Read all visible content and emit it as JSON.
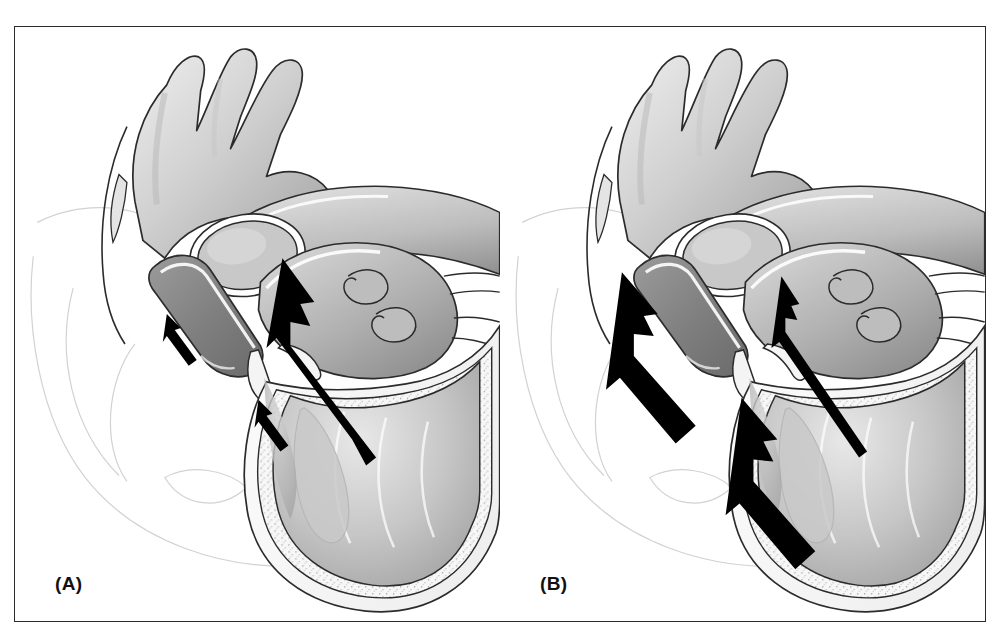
{
  "figure": {
    "kind": "medical-illustration",
    "view": "Four-chamber / long-axis cut with aortic arch",
    "style": "grayscale airbrushed line art",
    "frame_color": "#2b2b2b",
    "background_color": "#ffffff"
  },
  "panels": [
    {
      "id": "A",
      "label": "(A)",
      "caption_letter": "A",
      "arrows": [
        {
          "name": "left-atrium-inflow-arrow",
          "weight": "thin",
          "direction": "up-left"
        },
        {
          "name": "ventricle-inflow-arrow",
          "weight": "thin",
          "direction": "up-left"
        },
        {
          "name": "ventricle-outflow-arrow",
          "weight": "thick",
          "direction": "up-left"
        }
      ]
    },
    {
      "id": "B",
      "label": "(B)",
      "caption_letter": "B",
      "arrows": [
        {
          "name": "left-atrium-inflow-arrow",
          "weight": "thick",
          "direction": "up-left"
        },
        {
          "name": "ventricle-inflow-arrow",
          "weight": "thick",
          "direction": "up-left"
        },
        {
          "name": "ventricle-outflow-arrow",
          "weight": "thin",
          "direction": "up-left"
        }
      ]
    }
  ],
  "anatomy": {
    "structures": [
      "aortic arch",
      "brachiocephalic artery",
      "left common carotid artery",
      "left subclavian artery",
      "descending aorta",
      "right pulmonary artery (cross-section)",
      "left atrium",
      "pulmonary vein orifices",
      "left atrial appendage",
      "mitral valve leaflets",
      "left ventricle",
      "ventricular septum",
      "myocardial wall (stippled)",
      "papillary muscle / trabeculae"
    ]
  },
  "palette": {
    "ink": "#2b2b2b",
    "arrow_fill": "#000000",
    "tissue_light": "#dcdcdc",
    "tissue_mid": "#b4b4b4",
    "tissue_dark": "#8e8e8e",
    "tissue_shadow": "#6e6e6e",
    "highlight": "#ffffff",
    "ghost_outline": "#cfcfcf"
  }
}
